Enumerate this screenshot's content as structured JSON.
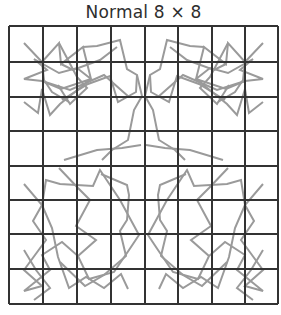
{
  "figure": {
    "title": "Normal 8 × 8",
    "grid": {
      "rows": 8,
      "cols": 8,
      "x_lines": [
        9,
        43,
        77,
        111,
        145,
        178,
        212,
        245,
        278
      ],
      "y_lines": [
        26,
        62,
        97,
        131,
        166,
        200,
        234,
        269,
        304
      ],
      "line_color": "#333333"
    },
    "pattern": {
      "stroke_color": "#999999",
      "description": "Symmetric gray polyline pattern overlaid on an 8x8 grid: two star/knot motifs in the top half, two oval lattice motifs in the bottom half, connected through the center."
    }
  }
}
